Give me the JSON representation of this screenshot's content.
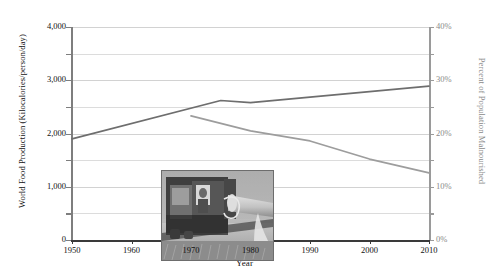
{
  "chart_data": {
    "type": "line",
    "title": "",
    "xlabel": "Year",
    "ylabel": "World Food Production (Kilocalories/person/day)",
    "ylabel_right": "Percent of Population Malnourished",
    "xlim": [
      1950,
      2010
    ],
    "ylim": [
      0,
      4000
    ],
    "ylim_right": [
      0,
      40
    ],
    "grid": true,
    "legend": "none",
    "x_ticks": [
      1950,
      1960,
      1970,
      1980,
      1990,
      2000,
      2010
    ],
    "x_tick_labels": [
      "1950",
      "1960",
      "1970",
      "1980",
      "1990",
      "2000",
      "2010"
    ],
    "y_ticks": [
      0,
      500,
      1000,
      1500,
      2000,
      2500,
      3000,
      3500,
      4000
    ],
    "y_tick_labels": [
      "0",
      "",
      "1,000",
      "",
      "2,000",
      "",
      "3,000",
      "",
      "4,000"
    ],
    "y_ticks_right": [
      0,
      5,
      10,
      15,
      20,
      25,
      30,
      35,
      40
    ],
    "y_tick_labels_right": [
      "0%",
      "",
      "10%",
      "",
      "20%",
      "",
      "30%",
      "",
      "40%"
    ],
    "series": [
      {
        "name": "World Food Production",
        "axis": "left",
        "color": "#6e6e6e",
        "x": [
          1950,
          1975,
          1980,
          2010
        ],
        "values": [
          1900,
          2620,
          2580,
          2890
        ]
      },
      {
        "name": "Percent of Population Malnourished",
        "axis": "right",
        "color": "#9d9d9d",
        "x": [
          1970,
          1980,
          1990,
          2000,
          2010
        ],
        "values": [
          23.3,
          20.5,
          18.6,
          15.2,
          12.6
        ]
      }
    ]
  },
  "axes": {
    "left_title": "World Food Production (Kilocalories/person/day)",
    "right_title": "Percent of Population Malnourished",
    "x_title": "Year"
  },
  "inset": {
    "name": "combine-harvester-photo",
    "caption": "",
    "description": "Black and white photograph of a combine harvester unloading grain in a wheat field"
  }
}
